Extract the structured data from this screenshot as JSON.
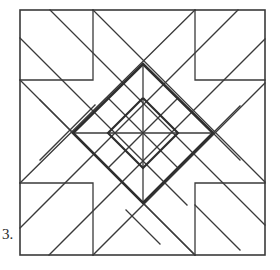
{
  "figure": {
    "label": "3.",
    "stroke_color": "#3a3a3a",
    "heavy_stroke_color": "#2e2e2e",
    "background": "#ffffff",
    "outer_square": {
      "x1": 20,
      "y1": 10,
      "x2": 265,
      "y2": 255
    },
    "corner_squares": [
      {
        "x1": 20,
        "y1": 10,
        "x2": 93,
        "y2": 80
      },
      {
        "x1": 195,
        "y1": 10,
        "x2": 265,
        "y2": 80
      },
      {
        "x1": 20,
        "y1": 183,
        "x2": 93,
        "y2": 255
      },
      {
        "x1": 195,
        "y1": 183,
        "x2": 265,
        "y2": 255
      }
    ],
    "center": {
      "x": 143,
      "y": 133
    },
    "heavy_diamond": {
      "top": [
        143,
        64
      ],
      "right": [
        213,
        133
      ],
      "bottom": [
        143,
        203
      ],
      "left": [
        73,
        133
      ]
    }
  }
}
